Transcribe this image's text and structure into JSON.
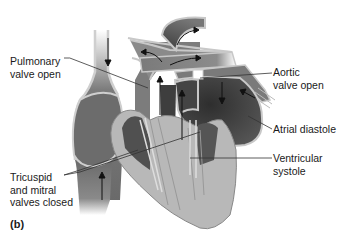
{
  "figure": {
    "panel_label": "(b)",
    "labels": {
      "pulmonary_valve": "Pulmonary\nvalve open",
      "aortic_valve": "Aortic\nvalve open",
      "atrial_diastole": "Atrial diastole",
      "ventricular_systole": "Ventricular\nsystole",
      "av_valves": "Tricuspid\nand mitral\nvalves closed"
    }
  },
  "colors": {
    "chamber_dark": "#4a4a4a",
    "chamber_mid": "#6e6e6e",
    "vessel_mid": "#8a8a8a",
    "vessel_wall": "#c8c8c8",
    "myocardium": "#b9b9b9",
    "leader_line": "#333333"
  }
}
